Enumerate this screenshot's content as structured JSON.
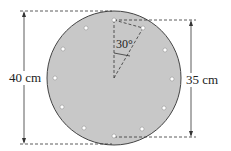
{
  "diagram": {
    "type": "circular plate with bolt holes",
    "labels": {
      "outer_diameter": "40 cm",
      "bolt_circle_diameter": "35 cm",
      "angle": "30°"
    },
    "bolt_hole_count": 12,
    "colors": {
      "plate_fill": "#c8c8c8",
      "plate_stroke": "#444444",
      "hole_fill": "#ffffff",
      "line": "#333333"
    }
  }
}
